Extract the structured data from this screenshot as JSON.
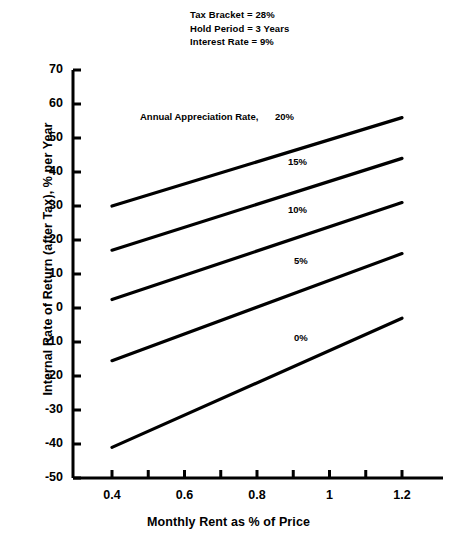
{
  "chart_data": {
    "type": "line",
    "title": "",
    "xlabel": "Monthly Rent as % of Price",
    "ylabel": "Internal Rate of Return (after Tax), % per Year",
    "xlim": [
      0.35,
      1.25
    ],
    "ylim": [
      -50,
      70
    ],
    "xticks": [
      0.4,
      0.5,
      0.6,
      0.7,
      0.8,
      0.9,
      1.0,
      1.1,
      1.2
    ],
    "xtick_labels": [
      "0.4",
      "",
      "0.6",
      "",
      "0.8",
      "",
      "1",
      "",
      "1.2"
    ],
    "yticks": [
      -50,
      -40,
      -30,
      -20,
      -10,
      0,
      10,
      20,
      30,
      40,
      50,
      60,
      70
    ],
    "ytick_labels": [
      "-50",
      "-40",
      "-30",
      "-20",
      "-10",
      "0",
      "10",
      "20",
      "30",
      "40",
      "50",
      "60",
      "70"
    ],
    "grid": false,
    "legend": "inline-annotations",
    "line_color": "#000000",
    "x": [
      0.4,
      1.2
    ],
    "series": [
      {
        "name": "20%",
        "values": [
          30,
          56
        ]
      },
      {
        "name": "15%",
        "values": [
          17,
          44
        ]
      },
      {
        "name": "10%",
        "values": [
          2.5,
          31
        ]
      },
      {
        "name": "5%",
        "values": [
          -15.5,
          16
        ]
      },
      {
        "name": "0%",
        "values": [
          -41,
          -3
        ]
      }
    ],
    "annotations": [
      {
        "text": "Annual Appreciation Rate,",
        "x_px": 140,
        "y_px": 111
      },
      {
        "text": "20%",
        "x_px": 275,
        "y_px": 111
      },
      {
        "text": "15%",
        "x_px": 288,
        "y_px": 156
      },
      {
        "text": "10%",
        "x_px": 288,
        "y_px": 204
      },
      {
        "text": "5%",
        "x_px": 294,
        "y_px": 255
      },
      {
        "text": "0%",
        "x_px": 294,
        "y_px": 332
      }
    ],
    "notes": [
      "Tax Bracket = 28%",
      "Hold Period = 3 Years",
      "Interest Rate = 9%"
    ]
  }
}
